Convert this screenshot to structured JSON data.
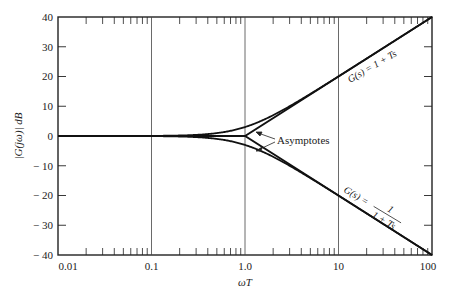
{
  "chart_data": {
    "type": "line",
    "title": "",
    "xlabel": "ωT",
    "ylabel": "|G(jω)| dB",
    "xscale": "log",
    "xlim": [
      0.01,
      100
    ],
    "ylim": [
      -40,
      40
    ],
    "x_ticks": [
      "0.01",
      "0.1",
      "1.0",
      "10",
      "100"
    ],
    "y_ticks": [
      "40",
      "30",
      "20",
      "10",
      "0",
      "− 10",
      "− 20",
      "− 30",
      "− 40"
    ],
    "grid": "vertical lines at decades",
    "legend": null,
    "series": [
      {
        "name": "G(s) = 1 + Ts (exact)",
        "x": [
          0.01,
          0.1,
          0.3,
          0.5,
          1.0,
          2.0,
          3.0,
          5.0,
          10,
          100
        ],
        "values": [
          0.0,
          0.04,
          0.37,
          0.97,
          3.01,
          6.99,
          10.0,
          14.15,
          20.04,
          40.0
        ]
      },
      {
        "name": "G(s) = 1/(1 + Ts) (exact)",
        "x": [
          0.01,
          0.1,
          0.3,
          0.5,
          1.0,
          2.0,
          3.0,
          5.0,
          10,
          100
        ],
        "values": [
          0.0,
          -0.04,
          -0.37,
          -0.97,
          -3.01,
          -6.99,
          -10.0,
          -14.15,
          -20.04,
          -40.0
        ]
      },
      {
        "name": "Asymptote (1 + Ts)",
        "x": [
          0.01,
          1.0,
          100
        ],
        "values": [
          0,
          0,
          40
        ]
      },
      {
        "name": "Asymptote (1/(1 + Ts))",
        "x": [
          0.01,
          1.0,
          100
        ],
        "values": [
          0,
          0,
          -40
        ]
      }
    ],
    "annotations": [
      {
        "text": "G(s) = 1 + Ts",
        "near": [
          20,
          26
        ]
      },
      {
        "text": "G(s) = 1/(1 + Ts)",
        "near": [
          20,
          -26
        ]
      },
      {
        "text": "Asymptotes",
        "near": [
          2.5,
          0
        ]
      }
    ]
  },
  "labels": {
    "xlabel": "ωT",
    "ylabel": "|G(jω)| dB",
    "asymptotes": "Asymptotes",
    "upper_curve": "G(s) = 1 + Ts",
    "lower_curve_prefix": "G(s) =",
    "lower_curve_num": "1",
    "lower_curve_den": "1 + Ts",
    "x_ticks": [
      "0.01",
      "0.1",
      "1.0",
      "10",
      "100"
    ],
    "y_ticks": [
      "40",
      "30",
      "20",
      "10",
      "0",
      "− 10",
      "− 20",
      "− 30",
      "− 40"
    ]
  }
}
